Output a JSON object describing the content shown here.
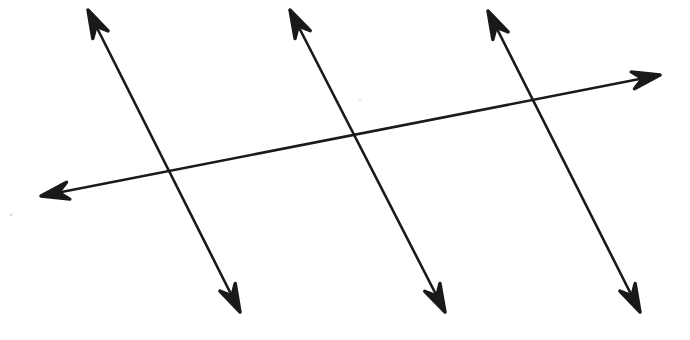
{
  "figure": {
    "background_color": "#ffffff",
    "stroke_color": "#1a1a1a",
    "stroke_width": 2.6,
    "canvas": {
      "width": 690,
      "height": 340
    },
    "caption": ""
  },
  "chart_data": {
    "type": "diagram",
    "xlabel": "",
    "ylabel": "",
    "xlim": [
      0,
      690
    ],
    "ylim": [
      0,
      340
    ],
    "grid": false,
    "legend": "none",
    "annotations": [],
    "series": [
      {
        "name": "parallel-line-1",
        "kind": "double-headed-arrow",
        "x": [
          88,
          240
        ],
        "y": [
          10,
          312
        ],
        "slope": 1.9868,
        "arrow_start": true,
        "arrow_end": true
      },
      {
        "name": "parallel-line-2",
        "kind": "double-headed-arrow",
        "x": [
          290,
          445
        ],
        "y": [
          10,
          312
        ],
        "slope": 1.9484,
        "arrow_start": true,
        "arrow_end": true
      },
      {
        "name": "parallel-line-3",
        "kind": "double-headed-arrow",
        "x": [
          488,
          640
        ],
        "y": [
          11,
          312
        ],
        "slope": 1.9803,
        "arrow_start": true,
        "arrow_end": true
      },
      {
        "name": "transversal-line",
        "kind": "double-headed-arrow",
        "x": [
          41,
          660
        ],
        "y": [
          196,
          75
        ],
        "slope": -0.1955,
        "arrow_start": true,
        "arrow_end": true
      }
    ],
    "intersections": [
      {
        "name": "intersection-1",
        "x": 170,
        "y": 172
      },
      {
        "name": "intersection-2",
        "x": 355,
        "y": 138
      },
      {
        "name": "intersection-3",
        "x": 530,
        "y": 103
      }
    ],
    "arrow_tips": [
      {
        "name": "line-1-upper-tip",
        "x": 88,
        "y": 10
      },
      {
        "name": "line-1-lower-tip",
        "x": 240,
        "y": 312
      },
      {
        "name": "line-2-upper-tip",
        "x": 290,
        "y": 10
      },
      {
        "name": "line-2-lower-tip",
        "x": 445,
        "y": 312
      },
      {
        "name": "line-3-upper-tip",
        "x": 488,
        "y": 11
      },
      {
        "name": "line-3-lower-tip",
        "x": 640,
        "y": 312
      },
      {
        "name": "transversal-left-tip",
        "x": 41,
        "y": 196
      },
      {
        "name": "transversal-right-tip",
        "x": 660,
        "y": 75
      }
    ],
    "specks": [
      {
        "name": "speck-left",
        "x": 11,
        "y": 215,
        "r": 1.6
      },
      {
        "name": "speck-mid",
        "x": 360,
        "y": 100,
        "r": 1.2
      }
    ]
  }
}
